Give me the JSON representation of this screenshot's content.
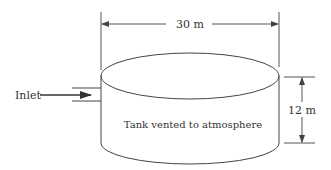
{
  "diagram": {
    "type": "tank-schematic",
    "tank": {
      "label": "Tank vented to atmosphere",
      "diameter_label": "30 m",
      "height_label": "12 m"
    },
    "inlet": {
      "label": "Inlet"
    },
    "colors": {
      "stroke": "#444444",
      "text": "#333333",
      "background": "#ffffff"
    }
  }
}
